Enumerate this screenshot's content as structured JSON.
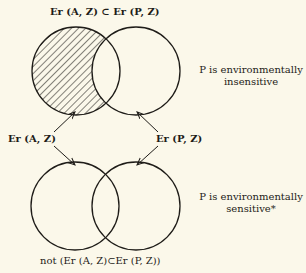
{
  "diagram": {
    "top_title": "Er (A, Z) ⊂ Er (P, Z)",
    "top_caption_line1": "P is environmentally",
    "top_caption_line2": "insensitive",
    "left_arrow_label": "Er (A, Z)",
    "right_arrow_label": "Er (P, Z)",
    "bottom_caption_line1": "P is environmentally",
    "bottom_caption_line2": "sensitive*",
    "bottom_title": "not (Er (A, Z)⊂Er (P, Z))",
    "colors": {
      "background": "#fbf8ea",
      "ink": "#1e1c18"
    },
    "top_venn": {
      "left_circle": {
        "cx": 76,
        "cy": 71,
        "r": 44,
        "hatched_region": "left-minus-right"
      },
      "right_circle": {
        "cx": 136,
        "cy": 71,
        "r": 44
      }
    },
    "bottom_venn": {
      "left_circle": {
        "cx": 75,
        "cy": 206,
        "r": 44
      },
      "right_circle": {
        "cx": 136,
        "cy": 206,
        "r": 44
      }
    }
  }
}
